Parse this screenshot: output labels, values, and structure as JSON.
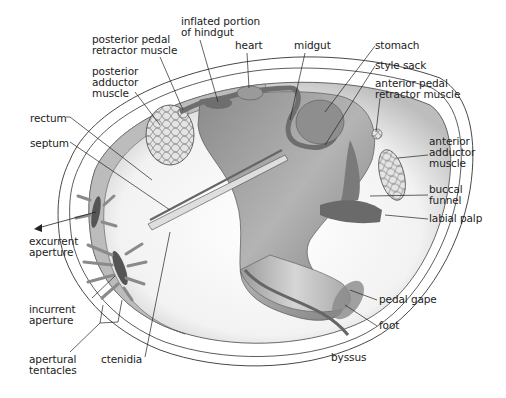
{
  "diagram": {
    "colors": {
      "background": "#ffffff",
      "outline": "#333333",
      "body_dark": "#6e6e6e",
      "body_mid": "#a0a0a0",
      "body_light": "#d8d8d8",
      "label_text": "#222222"
    },
    "labels": [
      {
        "id": "inflated-portion-of-hindgut",
        "text": "inflated portion\nof hindgut",
        "x": 181,
        "y": 16
      },
      {
        "id": "posterior-pedal-retractor-muscle",
        "text": "posterior pedal\nretractor muscle",
        "x": 92,
        "y": 34
      },
      {
        "id": "heart",
        "text": "heart",
        "x": 235,
        "y": 40
      },
      {
        "id": "midgut",
        "text": "midgut",
        "x": 294,
        "y": 40
      },
      {
        "id": "stomach",
        "text": "stomach",
        "x": 375,
        "y": 40
      },
      {
        "id": "posterior-adductor-muscle",
        "text": "posterior\nadductor\nmuscle",
        "x": 92,
        "y": 66
      },
      {
        "id": "style-sack",
        "text": "style sack",
        "x": 375,
        "y": 60
      },
      {
        "id": "anterior-pedal-retractor-muscle",
        "text": "anterior pedal\nretractor muscle",
        "x": 375,
        "y": 78
      },
      {
        "id": "rectum",
        "text": "rectum",
        "x": 30,
        "y": 113
      },
      {
        "id": "septum",
        "text": "septum",
        "x": 30,
        "y": 138
      },
      {
        "id": "anterior-adductor-muscle",
        "text": "anterior\nadductor\nmuscle",
        "x": 429,
        "y": 136
      },
      {
        "id": "buccal-funnel",
        "text": "buccal\nfunnel",
        "x": 429,
        "y": 184
      },
      {
        "id": "labial-palp",
        "text": "labial palp",
        "x": 429,
        "y": 213
      },
      {
        "id": "excurrent-aperture",
        "text": "excurrent\naperture",
        "x": 29,
        "y": 236
      },
      {
        "id": "incurrent-aperture",
        "text": "incurrent\naperture",
        "x": 29,
        "y": 304
      },
      {
        "id": "pedal-gape",
        "text": "pedal gape",
        "x": 379,
        "y": 294
      },
      {
        "id": "foot",
        "text": "foot",
        "x": 379,
        "y": 320
      },
      {
        "id": "apertural-tentacles",
        "text": "apertural\ntentacles",
        "x": 29,
        "y": 354
      },
      {
        "id": "ctenidia",
        "text": "ctenidia",
        "x": 101,
        "y": 354
      },
      {
        "id": "byssus",
        "text": "byssus",
        "x": 331,
        "y": 352
      }
    ]
  }
}
